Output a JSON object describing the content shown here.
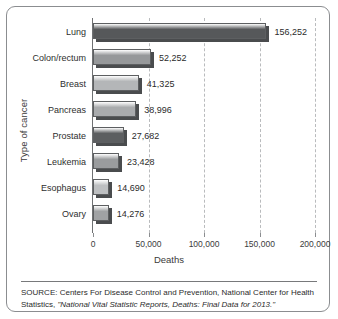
{
  "chart_data": {
    "type": "bar",
    "orientation": "horizontal",
    "title": "",
    "xlabel": "Deaths",
    "ylabel": "Type of cancer",
    "categories": [
      "Lung",
      "Colon/rectum",
      "Breast",
      "Pancreas",
      "Prostate",
      "Leukemia",
      "Esophagus",
      "Ovary"
    ],
    "values": [
      156252,
      52252,
      41325,
      38996,
      27682,
      23428,
      14690,
      14276
    ],
    "value_labels": [
      "156,252",
      "52,252",
      "41,325",
      "38,996",
      "27,682",
      "23,428",
      "14,690",
      "14,276"
    ],
    "xlim": [
      0,
      200000
    ],
    "xticks": [
      0,
      50000,
      100000,
      150000,
      200000
    ],
    "xtick_labels": [
      "0",
      "50,000",
      "100,000",
      "150,000",
      "200,000"
    ],
    "grid": "vertical-dashed",
    "legend": "none",
    "bar_colors": [
      "#56585a",
      "#96989a",
      "#b4b6b8",
      "#a9abad",
      "#5c5e60",
      "#9a9c9e",
      "#bdbfc1",
      "#a0a2a4"
    ]
  },
  "source": {
    "line1": "SOURCE: Centers For Disease Control and Prevention, National Center for",
    "line2_plain": "Health Statistics, ",
    "line2_italic": "\"National Vital Statistic Reports, Deaths: Final Data for 2013.\""
  }
}
